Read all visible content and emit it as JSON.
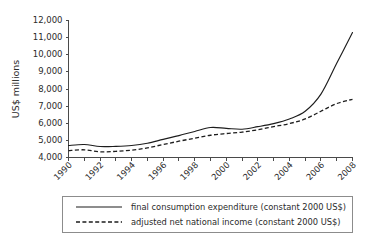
{
  "chart_data": {
    "type": "line",
    "title": "",
    "xlabel": "",
    "ylabel": "US$ millions",
    "ylim": [
      4000,
      12000
    ],
    "ytick_values": [
      4000,
      5000,
      6000,
      7000,
      8000,
      9000,
      10000,
      11000,
      12000
    ],
    "ytick_labels": [
      "4,000",
      "5,000",
      "6,000",
      "7,000",
      "8,000",
      "9,000",
      "10,000",
      "11,000",
      "12,000"
    ],
    "xlim": [
      1990,
      2008
    ],
    "xtick_labels": [
      "1990",
      "1992",
      "1994",
      "1996",
      "1998",
      "2000",
      "2002",
      "2004",
      "2006",
      "2008"
    ],
    "x": [
      1990,
      1991,
      1992,
      1993,
      1994,
      1995,
      1996,
      1997,
      1998,
      1999,
      2000,
      2001,
      2002,
      2003,
      2004,
      2005,
      2006,
      2007,
      2008
    ],
    "grid": false,
    "legend_position": "below-axes",
    "series": [
      {
        "name": "final consumption expenditure (constant 2000 US$)",
        "style": "solid",
        "color": "#1d1d1d",
        "values": [
          4700,
          4760,
          4640,
          4650,
          4700,
          4830,
          5060,
          5280,
          5520,
          5750,
          5700,
          5650,
          5800,
          5980,
          6250,
          6700,
          7700,
          9500,
          11300
        ]
      },
      {
        "name": "adjusted net national income (constant 2000 US$)",
        "style": "dashed",
        "color": "#1d1d1d",
        "values": [
          4400,
          4450,
          4330,
          4360,
          4430,
          4560,
          4760,
          4950,
          5130,
          5300,
          5400,
          5480,
          5620,
          5800,
          5980,
          6250,
          6700,
          7150,
          7400
        ]
      }
    ]
  },
  "legend": {
    "entries": [
      {
        "label": "final consumption expenditure (constant 2000 US$)",
        "style": "solid"
      },
      {
        "label": "adjusted net national income (constant 2000 US$)",
        "style": "dashed"
      }
    ]
  }
}
